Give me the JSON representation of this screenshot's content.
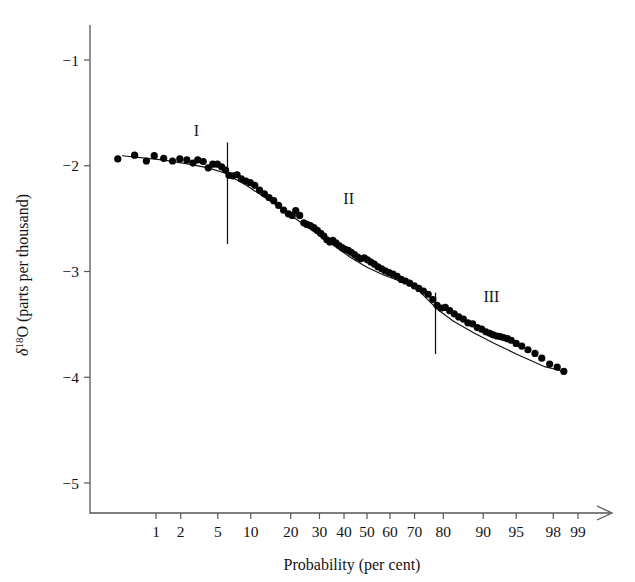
{
  "chart_data": {
    "type": "scatter",
    "title": "",
    "xlabel": "Probability (per cent)",
    "ylabel": "δ¹⁸O (parts per thousand)",
    "ylabel_symbol": "δ",
    "ylabel_superscript": "18",
    "ylabel_element": "O",
    "ylabel_units": "(parts per thousand)",
    "x_scale": "probability (probit)",
    "x_tick_labels": [
      "1",
      "2",
      "5",
      "10",
      "20",
      "30",
      "40",
      "50",
      "60",
      "70",
      "80",
      "90",
      "95",
      "98",
      "99"
    ],
    "x_tick_values": [
      1,
      2,
      5,
      10,
      20,
      30,
      40,
      50,
      60,
      70,
      80,
      90,
      95,
      98,
      99
    ],
    "y_tick_labels": [
      "−1",
      "−2",
      "−3",
      "−4",
      "−5"
    ],
    "y_tick_values": [
      -1,
      -2,
      -3,
      -4,
      -5
    ],
    "ylim": [
      -5.3,
      -0.6
    ],
    "grid": false,
    "legend": "none",
    "axis_arrow_x": true,
    "annotations": [
      {
        "label": "I",
        "x_percent": 3.0,
        "y": -1.72,
        "name": "region-label-i"
      },
      {
        "label": "II",
        "x_percent": 42.0,
        "y": -2.36,
        "name": "region-label-ii"
      },
      {
        "label": "III",
        "x_percent": 91.5,
        "y": -3.29,
        "name": "region-label-iii"
      }
    ],
    "dividers": [
      {
        "x_percent": 6.2,
        "y_top": -1.78,
        "y_bottom": -2.74,
        "name": "segment-divider-1"
      },
      {
        "x_percent": 77.5,
        "y_top": -3.2,
        "y_bottom": -3.78,
        "name": "segment-divider-2"
      }
    ],
    "fit_segments": [
      {
        "name": "fit-segment-i",
        "points": [
          [
            0.35,
            -1.905
          ],
          [
            1.2,
            -1.945
          ],
          [
            2.5,
            -1.985
          ],
          [
            4.0,
            -2.02
          ],
          [
            6.2,
            -2.075
          ]
        ]
      },
      {
        "name": "fit-segment-ii",
        "points": [
          [
            6.2,
            -2.085
          ],
          [
            9,
            -2.18
          ],
          [
            13,
            -2.3
          ],
          [
            18,
            -2.42
          ],
          [
            24,
            -2.55
          ],
          [
            30,
            -2.66
          ],
          [
            36,
            -2.76
          ],
          [
            43,
            -2.87
          ],
          [
            50,
            -2.96
          ],
          [
            57,
            -3.03
          ],
          [
            64,
            -3.09
          ],
          [
            70,
            -3.14
          ],
          [
            77.5,
            -3.34
          ]
        ]
      },
      {
        "name": "fit-segment-iii",
        "points": [
          [
            77.5,
            -3.345
          ],
          [
            83,
            -3.47
          ],
          [
            88,
            -3.58
          ],
          [
            92,
            -3.68
          ],
          [
            95,
            -3.78
          ],
          [
            97.5,
            -3.9
          ],
          [
            98.6,
            -3.95
          ]
        ]
      }
    ],
    "points": [
      [
        0.3,
        -1.935
      ],
      [
        0.52,
        -1.9
      ],
      [
        0.75,
        -1.955
      ],
      [
        0.95,
        -1.905
      ],
      [
        1.25,
        -1.93
      ],
      [
        1.6,
        -1.955
      ],
      [
        1.95,
        -1.935
      ],
      [
        2.35,
        -1.945
      ],
      [
        2.75,
        -1.975
      ],
      [
        3.1,
        -1.945
      ],
      [
        3.55,
        -1.96
      ],
      [
        4.0,
        -2.02
      ],
      [
        4.45,
        -1.985
      ],
      [
        4.95,
        -1.985
      ],
      [
        5.45,
        -2.01
      ],
      [
        5.95,
        -2.04
      ],
      [
        6.4,
        -2.09
      ],
      [
        6.95,
        -2.095
      ],
      [
        7.6,
        -2.085
      ],
      [
        8.3,
        -2.125
      ],
      [
        9.1,
        -2.145
      ],
      [
        9.9,
        -2.16
      ],
      [
        10.8,
        -2.185
      ],
      [
        11.8,
        -2.23
      ],
      [
        12.9,
        -2.265
      ],
      [
        14.0,
        -2.3
      ],
      [
        15.2,
        -2.33
      ],
      [
        16.5,
        -2.375
      ],
      [
        17.9,
        -2.42
      ],
      [
        19.3,
        -2.455
      ],
      [
        20.5,
        -2.47
      ],
      [
        21.6,
        -2.425
      ],
      [
        22.9,
        -2.47
      ],
      [
        24.3,
        -2.54
      ],
      [
        25.4,
        -2.555
      ],
      [
        26.6,
        -2.565
      ],
      [
        27.9,
        -2.585
      ],
      [
        29.2,
        -2.61
      ],
      [
        30.5,
        -2.64
      ],
      [
        31.7,
        -2.665
      ],
      [
        32.9,
        -2.7
      ],
      [
        34.1,
        -2.72
      ],
      [
        35.3,
        -2.705
      ],
      [
        36.6,
        -2.73
      ],
      [
        37.9,
        -2.755
      ],
      [
        39.2,
        -2.775
      ],
      [
        40.5,
        -2.79
      ],
      [
        41.8,
        -2.8
      ],
      [
        43.1,
        -2.82
      ],
      [
        44.5,
        -2.84
      ],
      [
        45.9,
        -2.865
      ],
      [
        47.3,
        -2.88
      ],
      [
        48.8,
        -2.87
      ],
      [
        50.2,
        -2.89
      ],
      [
        51.7,
        -2.91
      ],
      [
        53.2,
        -2.93
      ],
      [
        54.8,
        -2.955
      ],
      [
        56.4,
        -2.975
      ],
      [
        58.0,
        -2.995
      ],
      [
        59.6,
        -3.01
      ],
      [
        61.3,
        -3.025
      ],
      [
        63.0,
        -3.045
      ],
      [
        64.7,
        -3.075
      ],
      [
        66.4,
        -3.09
      ],
      [
        68.1,
        -3.11
      ],
      [
        69.9,
        -3.135
      ],
      [
        71.6,
        -3.16
      ],
      [
        73.3,
        -3.185
      ],
      [
        75.0,
        -3.215
      ],
      [
        76.6,
        -3.265
      ],
      [
        78.0,
        -3.32
      ],
      [
        79.3,
        -3.345
      ],
      [
        80.6,
        -3.34
      ],
      [
        81.9,
        -3.37
      ],
      [
        83.2,
        -3.4
      ],
      [
        84.4,
        -3.43
      ],
      [
        85.6,
        -3.45
      ],
      [
        86.7,
        -3.485
      ],
      [
        87.8,
        -3.495
      ],
      [
        88.8,
        -3.53
      ],
      [
        89.7,
        -3.545
      ],
      [
        90.5,
        -3.57
      ],
      [
        91.2,
        -3.585
      ],
      [
        91.8,
        -3.6
      ],
      [
        92.4,
        -3.61
      ],
      [
        92.9,
        -3.615
      ],
      [
        93.4,
        -3.625
      ],
      [
        93.9,
        -3.635
      ],
      [
        94.4,
        -3.65
      ],
      [
        95.0,
        -3.68
      ],
      [
        95.6,
        -3.705
      ],
      [
        96.2,
        -3.74
      ],
      [
        96.8,
        -3.775
      ],
      [
        97.3,
        -3.82
      ],
      [
        97.8,
        -3.875
      ],
      [
        98.2,
        -3.905
      ],
      [
        98.5,
        -3.945
      ]
    ]
  },
  "figure": {
    "background_color": "#ffffff",
    "data_color": "#050505",
    "axis_color": "#55565a",
    "fit_color": "#111111"
  }
}
